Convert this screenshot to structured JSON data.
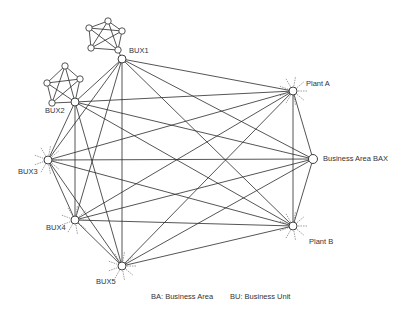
{
  "diagram": {
    "nodes": [
      {
        "id": "BUX1",
        "label": "BUX1",
        "x": 122,
        "y": 59,
        "lx": 129,
        "ly": 47
      },
      {
        "id": "BUX2",
        "label": "BUX2",
        "x": 75,
        "y": 102,
        "lx": 45,
        "ly": 107
      },
      {
        "id": "BUX3",
        "label": "BUX3",
        "x": 48,
        "y": 160,
        "lx": 18,
        "ly": 168
      },
      {
        "id": "BUX4",
        "label": "BUX4",
        "x": 75,
        "y": 220,
        "lx": 46,
        "ly": 224
      },
      {
        "id": "BUX5",
        "label": "BUX5",
        "x": 122,
        "y": 266,
        "lx": 96,
        "ly": 278
      },
      {
        "id": "PlantA",
        "label": "Plant A",
        "x": 293,
        "y": 91,
        "lx": 306,
        "ly": 80
      },
      {
        "id": "BAX",
        "label": "Business Area BAX",
        "x": 313,
        "y": 159,
        "lx": 323,
        "ly": 155
      },
      {
        "id": "PlantB",
        "label": "Plant B",
        "x": 293,
        "y": 226,
        "lx": 309,
        "ly": 238
      }
    ],
    "clusters": [
      {
        "attach": "BUX1",
        "nodes": [
          [
            108,
            21
          ],
          [
            122,
            31
          ],
          [
            118,
            50
          ],
          [
            91,
            48
          ],
          [
            89,
            28
          ]
        ]
      },
      {
        "attach": "BUX2",
        "nodes": [
          [
            65,
            66
          ],
          [
            80,
            79
          ],
          [
            75,
            102
          ],
          [
            52,
            103
          ],
          [
            47,
            83
          ]
        ]
      }
    ],
    "legend": {
      "ba": "BA: Business Area",
      "bu": "BU: Business Unit"
    },
    "colors": {
      "line": "#2a2a2a",
      "dash": "#777777",
      "node_fill": "#ffffff"
    }
  }
}
